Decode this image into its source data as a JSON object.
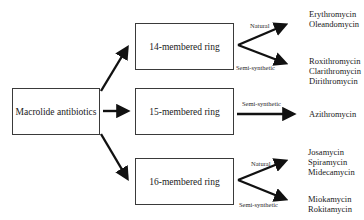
{
  "diagram": {
    "root": {
      "label": "Macrolide antibiotics"
    },
    "rings": [
      {
        "label": "14-membered ring",
        "branches": [
          {
            "label": "Natural",
            "drugs": [
              "Erythromycin",
              "Oleandomycin"
            ]
          },
          {
            "label": "Semi-synthetic",
            "drugs": [
              "Roxithromycin",
              "Clarithromycin",
              "Dirithromycin"
            ]
          }
        ]
      },
      {
        "label": "15-membered ring",
        "branches": [
          {
            "label": "Semi-synthetic",
            "drugs": [
              "Azithromycin"
            ]
          }
        ]
      },
      {
        "label": "16-membered ring",
        "branches": [
          {
            "label": "Natural",
            "drugs": [
              "Josamycin",
              "Spiramycin",
              "Midecamycin"
            ]
          },
          {
            "label": "Semi-synthetic",
            "drugs": [
              "Miokamycin",
              "Rokitamycin"
            ]
          }
        ]
      }
    ]
  }
}
